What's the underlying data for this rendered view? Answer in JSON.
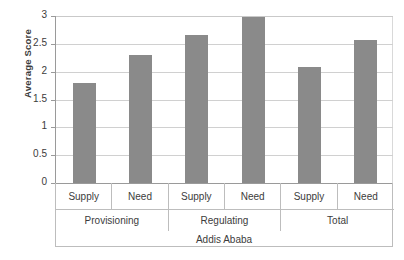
{
  "chart_data": {
    "type": "bar",
    "title": "",
    "xlabel": "Addis Ababa",
    "ylabel": "Average Score",
    "ylim": [
      0,
      3
    ],
    "ytick_labels": [
      "0",
      "0.5",
      "1",
      "1.5",
      "2",
      "2.5",
      "3"
    ],
    "ytick_values": [
      0,
      0.5,
      1,
      1.5,
      2,
      2.5,
      3
    ],
    "grid": true,
    "legend": "none",
    "categories": [
      "Supply",
      "Need",
      "Supply",
      "Need",
      "Supply",
      "Need"
    ],
    "groups": [
      "Provisioning",
      "Regulating",
      "Total"
    ],
    "values": [
      1.8,
      2.3,
      2.65,
      2.98,
      2.08,
      2.57
    ],
    "bar_color": "#8a8a8a",
    "grid_color": "#d0d0d0",
    "axis_color": "#9a9a9a",
    "points": [
      {
        "group": "Provisioning",
        "category": "Supply",
        "value": 1.8
      },
      {
        "group": "Provisioning",
        "category": "Need",
        "value": 2.3
      },
      {
        "group": "Regulating",
        "category": "Supply",
        "value": 2.65
      },
      {
        "group": "Regulating",
        "category": "Need",
        "value": 2.98
      },
      {
        "group": "Total",
        "category": "Supply",
        "value": 2.08
      },
      {
        "group": "Total",
        "category": "Need",
        "value": 2.57
      }
    ]
  }
}
